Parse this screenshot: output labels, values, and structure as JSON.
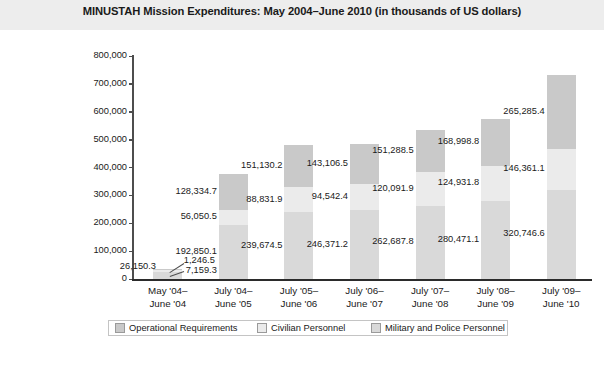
{
  "header": {
    "title": "MINUSTAH Mission Expenditures: May 2004–June 2010 (in thousands of US dollars)"
  },
  "chart_data": {
    "type": "bar",
    "stacked": true,
    "title": "MINUSTAH Mission Expenditures: May 2004–June 2010 (in thousands of US dollars)",
    "xlabel": "",
    "ylabel": "Expenditures",
    "ylim": [
      0,
      800000
    ],
    "ytick_step": 100000,
    "yticks": [
      "0",
      "100,000",
      "200,000",
      "300,000",
      "400,000",
      "500,000",
      "600,000",
      "700,000",
      "800,000"
    ],
    "grid": false,
    "legend_position": "bottom",
    "categories": [
      "May '04–June '04",
      "July '04–June '05",
      "July '05–June '06",
      "July '06–June '07",
      "July '07–June '08",
      "July '08–June '09",
      "July '09–June '10"
    ],
    "categories_lines": [
      [
        "May '04–",
        "June '04"
      ],
      [
        "July '04–",
        "June '05"
      ],
      [
        "July '05–",
        "June '06"
      ],
      [
        "July '06–",
        "June '07"
      ],
      [
        "July '07–",
        "June '08"
      ],
      [
        "July '08–",
        "June '09"
      ],
      [
        "July '09–",
        "June '10"
      ]
    ],
    "series": [
      {
        "name": "Military and Police Personnel",
        "color": "#d9d9d9",
        "values": [
          26150.3,
          192850.1,
          239674.5,
          246371.2,
          262687.8,
          280471.1,
          320746.6
        ],
        "labels": [
          "26,150.3",
          "192,850.1",
          "239,674.5",
          "246,371.2",
          "262,687.8",
          "280,471.1",
          "320,746.6"
        ]
      },
      {
        "name": "Civilian Personnel",
        "color": "#ebebeb",
        "values": [
          7159.3,
          56050.5,
          88831.9,
          94542.4,
          120091.9,
          124931.8,
          146361.1
        ],
        "labels": [
          "7,159.3",
          "56,050.5",
          "88,831.9",
          "94,542.4",
          "120,091.9",
          "124,931.8",
          "146,361.1"
        ]
      },
      {
        "name": "Operational Requirements",
        "color": "#c9c9c9",
        "values": [
          1246.5,
          128334.7,
          151130.2,
          143106.5,
          151288.5,
          168998.8,
          265285.4
        ],
        "labels": [
          "1,246.5",
          "128,334.7",
          "151,130.2",
          "143,106.5",
          "151,288.5",
          "168,998.8",
          "265,285.4"
        ]
      }
    ],
    "totals": [
      34556.1,
      377235.3,
      479636.6,
      484020.1,
      534068.2,
      574401.7,
      732393.1
    ]
  },
  "legend": {
    "items": [
      {
        "label": "Operational Requirements",
        "color": "#c9c9c9"
      },
      {
        "label": "Civilian Personnel",
        "color": "#ebebeb"
      },
      {
        "label": "Military and Police Personnel",
        "color": "#d9d9d9"
      }
    ]
  },
  "colors": {
    "header_band": "#ededed",
    "axis": "#2b2b2b",
    "text": "#1a1a1a"
  }
}
